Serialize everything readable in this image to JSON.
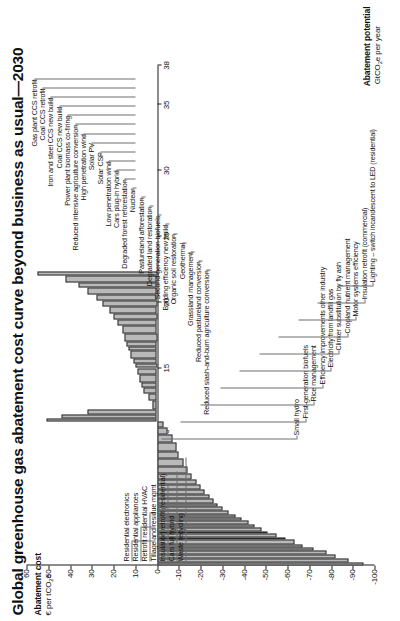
{
  "title": "Global greenhouse gas abatement cost curve beyond business as usual—2030",
  "axes": {
    "y_title": "Abatement cost",
    "y_units": "€ per tCO2e",
    "y_units_pre": "€ per tCO",
    "y_units_sub": "2",
    "y_units_post": "e",
    "x_title": "Abatement potential",
    "x_units_pre": "GtCO",
    "x_units_sub": "2",
    "x_units_post": "e per year",
    "y_ticks": [
      60,
      50,
      40,
      30,
      20,
      10,
      0,
      -10,
      -20,
      -30,
      -40,
      -50,
      -60,
      -70,
      -80,
      -90,
      -100
    ],
    "x_ticks": [
      0,
      5,
      10,
      15,
      20,
      25,
      30,
      35,
      38
    ],
    "x_min": 0,
    "x_max": 38,
    "y_min": -100,
    "y_max": 60
  },
  "chart_data": {
    "type": "bar",
    "title": "Global greenhouse gas abatement cost curve beyond business as usual—2030",
    "xlabel": "Abatement potential GtCO2e per year",
    "ylabel": "Abatement cost € per tCO2e",
    "xlim": [
      0,
      38
    ],
    "ylim": [
      -100,
      60
    ],
    "grid": false,
    "legend": "none",
    "note": "McKinsey-style marginal abatement cost curve: bar width = abatement potential (GtCO2e/yr), bar height = cost (€/tCO2e). Bars sorted ascending by cost.",
    "bars": [
      {
        "label": "Lighting – switch incandescent to LED (residential)",
        "width": 0.22,
        "cost": -95
      },
      {
        "label": "Insulation retrofit (commercial)",
        "width": 0.28,
        "cost": -88
      },
      {
        "label": "Motor systems efficiency",
        "width": 0.33,
        "cost": -82
      },
      {
        "label": "Cropland nutrient management",
        "width": 0.3,
        "cost": -78
      },
      {
        "label": "Clinker substitution by fly ash",
        "width": 0.25,
        "cost": -72
      },
      {
        "label": "Electricity from landfill gas",
        "width": 0.22,
        "cost": -67
      },
      {
        "label": "Efficiency improvements other industry",
        "width": 0.34,
        "cost": -63
      },
      {
        "label": "Rice management",
        "width": 0.22,
        "cost": -59
      },
      {
        "label": "First-generation biofuels",
        "width": 0.24,
        "cost": -55
      },
      {
        "label": "Small hydro",
        "width": 0.22,
        "cost": -51
      },
      {
        "label": "unlabelled",
        "width": 0.26,
        "cost": -48
      },
      {
        "label": "unlabelled",
        "width": 0.22,
        "cost": -45
      },
      {
        "label": "unlabelled",
        "width": 0.3,
        "cost": -42
      },
      {
        "label": "unlabelled",
        "width": 0.26,
        "cost": -39
      },
      {
        "label": "unlabelled",
        "width": 0.24,
        "cost": -36
      },
      {
        "label": "unlabelled",
        "width": 0.3,
        "cost": -33
      },
      {
        "label": "unlabelled",
        "width": 0.28,
        "cost": -30
      },
      {
        "label": "unlabelled",
        "width": 0.26,
        "cost": -28
      },
      {
        "label": "unlabelled",
        "width": 0.34,
        "cost": -26
      },
      {
        "label": "unlabelled",
        "width": 0.3,
        "cost": -24
      },
      {
        "label": "unlabelled",
        "width": 0.42,
        "cost": -22
      },
      {
        "label": "unlabelled",
        "width": 0.36,
        "cost": -20
      },
      {
        "label": "unlabelled",
        "width": 0.38,
        "cost": -18
      },
      {
        "label": "unlabelled",
        "width": 0.46,
        "cost": -16
      },
      {
        "label": "unlabelled",
        "width": 0.52,
        "cost": -14
      },
      {
        "label": "unlabelled",
        "width": 0.6,
        "cost": -12
      },
      {
        "label": "Cars full hybrid",
        "width": 0.55,
        "cost": -10
      },
      {
        "label": "unlabelled",
        "width": 0.7,
        "cost": -9
      },
      {
        "label": "Waste recycling",
        "width": 0.62,
        "cost": -7
      },
      {
        "label": "Insulation retrofit (residential)",
        "width": 0.5,
        "cost": -5
      },
      {
        "label": "Tillage and residue mgmt",
        "width": 0.45,
        "cost": -3
      },
      {
        "label": "Retrofit residential HVAC",
        "width": 0.4,
        "cost": 32
      },
      {
        "label": "Residential appliances",
        "width": 0.3,
        "cost": 44
      },
      {
        "label": "Residential electronics",
        "width": 0.25,
        "cost": 51
      },
      {
        "label": "Building efficiency new build",
        "width": 0.62,
        "cost": 2
      },
      {
        "label": "Second-generation biofuels",
        "width": 0.55,
        "cost": 4
      },
      {
        "label": "Degraded land restoration",
        "width": 0.45,
        "cost": 6
      },
      {
        "label": "Pastureland afforestation",
        "width": 0.4,
        "cost": 7
      },
      {
        "label": "Nuclear",
        "width": 0.6,
        "cost": 8
      },
      {
        "label": "Degraded forest reforestation",
        "width": 0.5,
        "cost": 9
      },
      {
        "label": "Cars plug-in hybrid",
        "width": 0.35,
        "cost": 10
      },
      {
        "label": "Low penetration wind",
        "width": 0.4,
        "cost": 11
      },
      {
        "label": "Organic soil restoration",
        "width": 0.55,
        "cost": 12
      },
      {
        "label": "Geothermal",
        "width": 0.35,
        "cost": 13
      },
      {
        "label": "Grassland management",
        "width": 0.4,
        "cost": 14
      },
      {
        "label": "Reduced pastureland conversion",
        "width": 0.6,
        "cost": 15
      },
      {
        "label": "Reduced slash-and-burn agriculture conversion",
        "width": 0.55,
        "cost": 16
      },
      {
        "label": "Solar CSP",
        "width": 0.45,
        "cost": 18
      },
      {
        "label": "Solar PV",
        "width": 0.5,
        "cost": 20
      },
      {
        "label": "High penetration wind",
        "width": 0.55,
        "cost": 22
      },
      {
        "label": "Reduced intensive agriculture conversion",
        "width": 0.4,
        "cost": 25
      },
      {
        "label": "Power plant biomass co-firing",
        "width": 0.45,
        "cost": 28
      },
      {
        "label": "Coal CCS new build",
        "width": 0.55,
        "cost": 32
      },
      {
        "label": "Iron and steel CCS new build",
        "width": 0.4,
        "cost": 36
      },
      {
        "label": "Coal CCS retrofit",
        "width": 0.5,
        "cost": 42
      },
      {
        "label": "Gas plant CCS retrofit",
        "width": 0.35,
        "cost": 55
      }
    ]
  },
  "callouts": {
    "top": [
      "Gas plant CCS retrofit",
      "Coal CCS retrofit",
      "Iron and steel CCS new build",
      "Coal CCS new build",
      "Power plant biomass co-firing",
      "Reduced intensive agriculture conversion",
      "High penetration wind",
      "Solar PV",
      "Solar CSP",
      "Low penetration wind",
      "Cars plug-in hybrid",
      "Degraded forest reforestation",
      "Nuclear",
      "Pastureland afforestation",
      "Degraded land restoration",
      "Second-generation biofuels",
      "Building efficiency new build",
      "Organic soil restoration",
      "Geothermal",
      "Grassland management",
      "Reduced pastureland conversion",
      "Reduced slash-and-burn agriculture conversion"
    ],
    "left_high": [
      "Residential electronics",
      "Residential appliances",
      "Retrofit residential HVAC",
      "Tillage and residue mgmt",
      "Insulation retrofit (residential)",
      "Cars full hybrid",
      "Waste recycling"
    ],
    "bottom": [
      "Small hydro",
      "First-generation biofuels",
      "Rice management",
      "Efficiency improvements other industry",
      "Electricity from landfill gas",
      "Clinker substitution by fly ash",
      "Cropland nutrient management",
      "Motor systems efficiency",
      "Insulation retrofit (commercial)",
      "Lighting – switch incandescent to LED (residential)"
    ]
  }
}
